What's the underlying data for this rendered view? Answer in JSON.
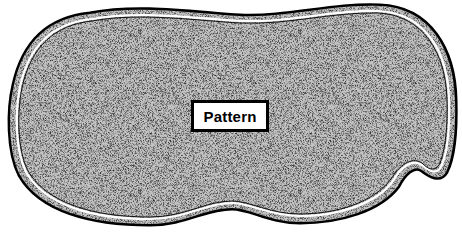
{
  "diagram": {
    "shape": "irregular rounded blob outline with stippled fill",
    "label": "Pattern",
    "colors": {
      "outline": "#000000",
      "fill_base": "#bdbdbd",
      "stipple_dark": "#3a3a3a",
      "background": "#ffffff",
      "label_bg": "#ffffff"
    }
  }
}
